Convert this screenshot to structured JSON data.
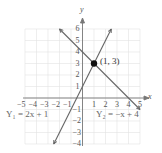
{
  "chart_data": {
    "type": "line",
    "title": "",
    "xlabel": "x",
    "ylabel": "y",
    "xlim": [
      -5,
      5
    ],
    "ylim": [
      -4,
      6
    ],
    "grid": true,
    "x_ticks": [
      "-5",
      "-4",
      "-3",
      "-2",
      "-1",
      "1",
      "2",
      "3",
      "4",
      "5"
    ],
    "y_ticks": [
      "6",
      "5",
      "4",
      "3",
      "2",
      "1",
      "-1",
      "-2",
      "-3",
      "-4"
    ],
    "series": [
      {
        "name": "Y1 = 2x + 1",
        "label": "Y₁ = 2x + 1",
        "slope": 2,
        "intercept": 1,
        "x": [
          -2.5,
          2.5
        ],
        "y": [
          -4,
          6
        ]
      },
      {
        "name": "Y2 = -x + 4",
        "label": "Y₂ = −x + 4",
        "slope": -1,
        "intercept": 4,
        "x": [
          -2,
          5
        ],
        "y": [
          6,
          -1
        ]
      }
    ],
    "annotations": [
      {
        "type": "point",
        "x": 1,
        "y": 3,
        "label": "(1, 3)"
      }
    ]
  },
  "labels": {
    "x_axis": "x",
    "y_axis": "y",
    "eq1": "Y₁ = 2x + 1",
    "eq2": "Y₂ = −x + 4",
    "intersection": "(1, 3)"
  }
}
